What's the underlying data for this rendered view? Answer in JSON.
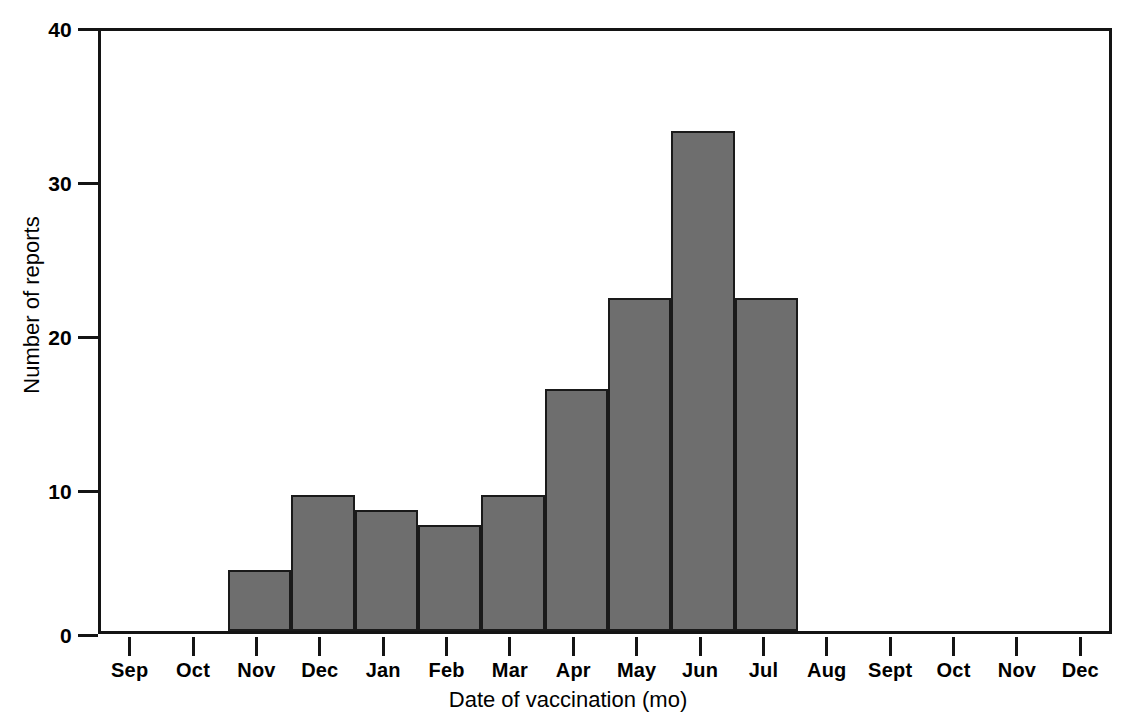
{
  "chart_data": {
    "type": "bar",
    "title": "",
    "subtitle": "",
    "xlabel": "Date of vaccination (mo)",
    "ylabel": "Number of reports",
    "categories": [
      "Sep",
      "Oct",
      "Nov",
      "Dec",
      "Jan",
      "Feb",
      "Mar",
      "Apr",
      "May",
      "Jun",
      "Jul",
      "Aug",
      "Sept",
      "Oct",
      "Nov",
      "Dec"
    ],
    "values": [
      0,
      0,
      4,
      9,
      8,
      7,
      9,
      16,
      22,
      33,
      22,
      0,
      0,
      0,
      0,
      0
    ],
    "ylim": [
      0,
      40
    ],
    "yticks": [
      0,
      10,
      20,
      30,
      40
    ],
    "ytick_labels": [
      "0",
      "10",
      "20",
      "30",
      "40"
    ],
    "grid": false,
    "legend": null,
    "bar_fill_color": "#6e6e6e",
    "bar_edge_color": "#1a1a1a",
    "axis_color": "#141414",
    "background_color": "#ffffff"
  },
  "axes": {
    "y_title": "Number of reports",
    "x_title": "Date of vaccination (mo)"
  }
}
